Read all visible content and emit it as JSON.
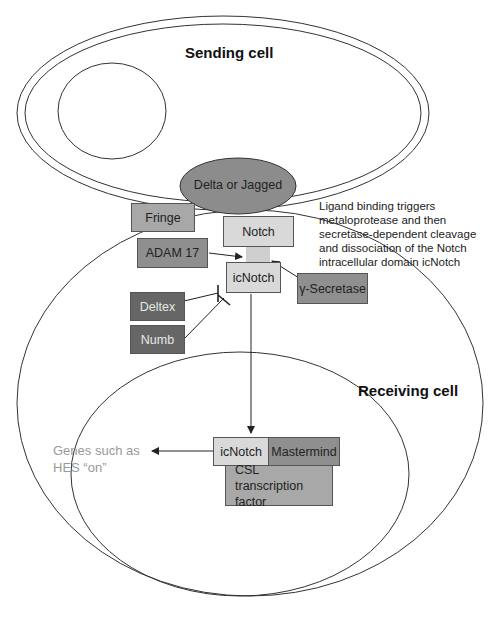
{
  "diagram": {
    "sending_cell": {
      "label": "Sending cell"
    },
    "receiving_cell": {
      "label": "Receiving cell"
    },
    "nodes": {
      "ligand": {
        "label": "Delta or Jagged",
        "color": "#8c8c8c"
      },
      "fringe": {
        "label": "Fringe",
        "color": "#a8a8a8"
      },
      "notch": {
        "label": "Notch",
        "color": "#d9d9d9"
      },
      "adam17": {
        "label": "ADAM 17",
        "color": "#8f8f8f"
      },
      "icnotch": {
        "label": "icNotch",
        "color": "#d9d9d9"
      },
      "gamma_secretase": {
        "label": "γ-Secretase",
        "color": "#8f8f8f"
      },
      "deltex": {
        "label": "Deltex",
        "color": "#666666"
      },
      "numb": {
        "label": "Numb",
        "color": "#666666"
      },
      "nuclear_icnotch": {
        "label": "icNotch",
        "color": "#d9d9d9"
      },
      "mastermind": {
        "label": "Mastermind",
        "color": "#8f8f8f"
      },
      "csl": {
        "label": "CSL transcription factor",
        "color": "#a8a8a8"
      }
    },
    "annotation": "Ligand binding triggers metaloprotease and then secretase-dependent cleavage and dissociation of the Notch intracellular domain icNotch",
    "output_genes": "Genes such as HES “on”",
    "edges": [
      {
        "from": "adam17",
        "to": "cleavage-site",
        "type": "arrow"
      },
      {
        "from": "gamma_secretase",
        "to": "cleavage-site",
        "type": "arrow"
      },
      {
        "from": "deltex",
        "to": "icnotch",
        "type": "inhibit"
      },
      {
        "from": "numb",
        "to": "icnotch",
        "type": "inhibit"
      },
      {
        "from": "icnotch",
        "to": "nuclear_icnotch",
        "type": "arrow"
      },
      {
        "from": "nuclear_icnotch",
        "to": "output_genes",
        "type": "arrow"
      }
    ]
  }
}
